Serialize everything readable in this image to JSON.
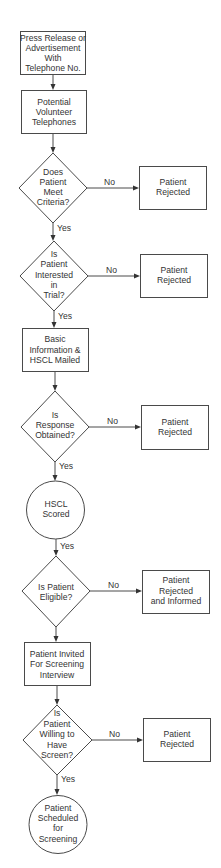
{
  "diagram": {
    "type": "flowchart",
    "nodes": [
      {
        "id": "n1",
        "shape": "rect",
        "lines": [
          "Press Release or",
          "Advertisement",
          "With",
          "Telephone No."
        ]
      },
      {
        "id": "n2",
        "shape": "rect",
        "lines": [
          "Potential",
          "Volunteer",
          "Telephones"
        ]
      },
      {
        "id": "d1",
        "shape": "diamond",
        "lines": [
          "Does",
          "Patient",
          "Meet",
          "Criteria?"
        ]
      },
      {
        "id": "r1",
        "shape": "rect",
        "lines": [
          "Patient",
          "Rejected"
        ]
      },
      {
        "id": "d2",
        "shape": "diamond",
        "lines": [
          "Is",
          "Patient",
          "Interested",
          "in",
          "Trial?"
        ]
      },
      {
        "id": "r2",
        "shape": "rect",
        "lines": [
          "Patient",
          "Rejected"
        ]
      },
      {
        "id": "n3",
        "shape": "rect",
        "lines": [
          "Basic",
          "Information &",
          "HSCL Mailed"
        ]
      },
      {
        "id": "d3",
        "shape": "diamond",
        "lines": [
          "Is",
          "Response",
          "Obtained?"
        ]
      },
      {
        "id": "r3",
        "shape": "rect",
        "lines": [
          "Patient",
          "Rejected"
        ]
      },
      {
        "id": "c1",
        "shape": "circle",
        "lines": [
          "HSCL",
          "Scored"
        ]
      },
      {
        "id": "d4",
        "shape": "diamond",
        "lines": [
          "Is Patient",
          "Eligible?"
        ]
      },
      {
        "id": "r4",
        "shape": "rect",
        "lines": [
          "Patient",
          "Rejected",
          "and Informed"
        ]
      },
      {
        "id": "n4",
        "shape": "rect",
        "lines": [
          "Patient Invited",
          "For Screening",
          "Interview"
        ]
      },
      {
        "id": "d5",
        "shape": "diamond",
        "lines": [
          "Is",
          "Patient",
          "Willing to",
          "Have",
          "Screen?"
        ]
      },
      {
        "id": "r5",
        "shape": "rect",
        "lines": [
          "Patient",
          "Rejected"
        ]
      },
      {
        "id": "c2",
        "shape": "circle",
        "lines": [
          "Patient",
          "Scheduled",
          "for",
          "Screening"
        ]
      }
    ],
    "edges": [
      {
        "from": "n1",
        "to": "n2",
        "label": ""
      },
      {
        "from": "n2",
        "to": "d1",
        "label": ""
      },
      {
        "from": "d1",
        "to": "r1",
        "label": "No"
      },
      {
        "from": "d1",
        "to": "d2",
        "label": "Yes"
      },
      {
        "from": "d2",
        "to": "r2",
        "label": "No"
      },
      {
        "from": "d2",
        "to": "n3",
        "label": "Yes"
      },
      {
        "from": "n3",
        "to": "d3",
        "label": ""
      },
      {
        "from": "d3",
        "to": "r3",
        "label": "No"
      },
      {
        "from": "d3",
        "to": "c1",
        "label": "Yes"
      },
      {
        "from": "c1",
        "to": "d4",
        "label": "Yes"
      },
      {
        "from": "d4",
        "to": "r4",
        "label": "No"
      },
      {
        "from": "d4",
        "to": "n4",
        "label": ""
      },
      {
        "from": "n4",
        "to": "d5",
        "label": ""
      },
      {
        "from": "d5",
        "to": "r5",
        "label": "No"
      },
      {
        "from": "d5",
        "to": "c2",
        "label": "Yes"
      }
    ]
  },
  "labels": {
    "n1": [
      "Press Release or",
      "Advertisement",
      "With",
      "Telephone No."
    ],
    "n2": [
      "Potential",
      "Volunteer",
      "Telephones"
    ],
    "d1": [
      "Does",
      "Patient",
      "Meet",
      "Criteria?"
    ],
    "r1": [
      "Patient",
      "Rejected"
    ],
    "d2": [
      "Is",
      "Patient",
      "Interested",
      "in",
      "Trial?"
    ],
    "r2": [
      "Patient",
      "Rejected"
    ],
    "n3": [
      "Basic",
      "Information &",
      "HSCL Mailed"
    ],
    "d3": [
      "Is",
      "Response",
      "Obtained?"
    ],
    "r3": [
      "Patient",
      "Rejected"
    ],
    "c1": [
      "HSCL",
      "Scored"
    ],
    "d4": [
      "Is Patient",
      "Eligible?"
    ],
    "r4": [
      "Patient",
      "Rejected",
      "and Informed"
    ],
    "n4": [
      "Patient Invited",
      "For Screening",
      "Interview"
    ],
    "d5": [
      "Is",
      "Patient",
      "Willing to",
      "Have",
      "Screen?"
    ],
    "r5": [
      "Patient",
      "Rejected"
    ],
    "c2": [
      "Patient",
      "Scheduled",
      "for",
      "Screening"
    ]
  },
  "edge_labels": {
    "yes": "Yes",
    "no": "No"
  },
  "colors": {
    "stroke": "#4a4a4a",
    "text": "#333333",
    "background": "#ffffff"
  }
}
